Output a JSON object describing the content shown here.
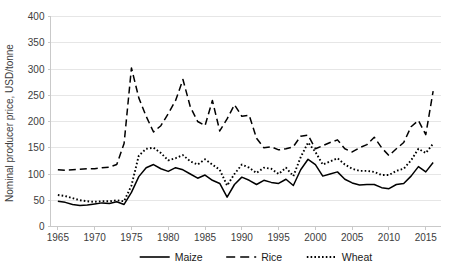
{
  "chart_data": {
    "type": "line",
    "title": "",
    "xlabel": "",
    "ylabel": "Nominal producer price, USD/tonne",
    "xlim": [
      1964,
      2017
    ],
    "ylim": [
      0,
      400
    ],
    "ytick_step": 50,
    "yticks": [
      "0",
      "50",
      "100",
      "150",
      "200",
      "250",
      "300",
      "350",
      "400"
    ],
    "xticks": [
      "1965",
      "1970",
      "1975",
      "1980",
      "1985",
      "1990",
      "1995",
      "2000",
      "2005",
      "2010",
      "2015"
    ],
    "grid": "horizontal",
    "legend_position": "bottom",
    "x": [
      1965,
      1966,
      1967,
      1968,
      1969,
      1970,
      1971,
      1972,
      1973,
      1974,
      1975,
      1976,
      1977,
      1978,
      1979,
      1980,
      1981,
      1982,
      1983,
      1984,
      1985,
      1986,
      1987,
      1988,
      1989,
      1990,
      1991,
      1992,
      1993,
      1994,
      1995,
      1996,
      1997,
      1998,
      1999,
      2000,
      2001,
      2002,
      2003,
      2004,
      2005,
      2006,
      2007,
      2008,
      2009,
      2010,
      2011,
      2012,
      2013,
      2014,
      2015,
      2016
    ],
    "series": [
      {
        "name": "Maize",
        "style": "solid",
        "color": "#000000",
        "values": [
          48,
          46,
          42,
          40,
          41,
          43,
          45,
          44,
          47,
          42,
          65,
          95,
          112,
          118,
          110,
          105,
          112,
          108,
          100,
          92,
          98,
          88,
          82,
          56,
          80,
          94,
          88,
          80,
          88,
          84,
          82,
          90,
          78,
          108,
          128,
          118,
          96,
          100,
          104,
          90,
          83,
          79,
          80,
          80,
          74,
          72,
          80,
          82,
          96,
          114,
          104,
          122
        ],
        "last_peaks": [
          {
            "year": 2008,
            "value": 205
          },
          {
            "year": 2011,
            "value": 272
          }
        ]
      },
      {
        "name": "Rice",
        "style": "dashed",
        "color": "#000000",
        "values": [
          108,
          107,
          108,
          109,
          110,
          110,
          112,
          113,
          118,
          158,
          302,
          245,
          210,
          180,
          192,
          215,
          240,
          280,
          228,
          200,
          192,
          240,
          182,
          205,
          232,
          210,
          212,
          168,
          150,
          152,
          146,
          148,
          152,
          172,
          174,
          148,
          154,
          160,
          165,
          148,
          142,
          150,
          156,
          170,
          150,
          135,
          148,
          160,
          190,
          202,
          175,
          258
        ],
        "peak_notes": [
          {
            "year": 1974,
            "value": 302
          },
          {
            "year": 2008,
            "value": 360
          },
          {
            "year": 2011,
            "value": 348
          }
        ]
      },
      {
        "name": "Wheat",
        "style": "dotted",
        "color": "#000000",
        "values": [
          60,
          58,
          54,
          50,
          48,
          47,
          48,
          48,
          50,
          48,
          78,
          135,
          148,
          150,
          140,
          126,
          130,
          136,
          124,
          118,
          128,
          118,
          108,
          78,
          100,
          118,
          112,
          102,
          112,
          110,
          100,
          112,
          96,
          132,
          160,
          142,
          118,
          124,
          130,
          118,
          110,
          106,
          106,
          104,
          98,
          98,
          106,
          110,
          126,
          148,
          140,
          158
        ]
      }
    ],
    "series_plot": {
      "Maize": [
        [
          1965,
          48
        ],
        [
          1966,
          46
        ],
        [
          1967,
          42
        ],
        [
          1968,
          40
        ],
        [
          1969,
          41
        ],
        [
          1970,
          43
        ],
        [
          1971,
          45
        ],
        [
          1972,
          44
        ],
        [
          1973,
          47
        ],
        [
          1974,
          42
        ],
        [
          1975,
          65
        ],
        [
          1976,
          95
        ],
        [
          1977,
          112
        ],
        [
          1978,
          118
        ],
        [
          1979,
          110
        ],
        [
          1980,
          105
        ],
        [
          1981,
          112
        ],
        [
          1982,
          108
        ],
        [
          1983,
          100
        ],
        [
          1984,
          92
        ],
        [
          1985,
          98
        ],
        [
          1986,
          88
        ],
        [
          1987,
          82
        ],
        [
          1988,
          56
        ],
        [
          1989,
          80
        ],
        [
          1990,
          94
        ],
        [
          1991,
          88
        ],
        [
          1992,
          80
        ],
        [
          1993,
          88
        ],
        [
          1994,
          84
        ],
        [
          1995,
          82
        ],
        [
          1996,
          90
        ],
        [
          1997,
          78
        ],
        [
          1998,
          108
        ],
        [
          1999,
          128
        ],
        [
          2000,
          118
        ],
        [
          2001,
          96
        ],
        [
          2002,
          100
        ],
        [
          2003,
          104
        ],
        [
          2004,
          90
        ],
        [
          2005,
          83
        ],
        [
          2006,
          79
        ],
        [
          2007,
          80
        ],
        [
          2008,
          80
        ],
        [
          2009,
          74
        ],
        [
          2010,
          72
        ],
        [
          2011,
          80
        ],
        [
          2012,
          82
        ],
        [
          2013,
          96
        ],
        [
          2014,
          114
        ],
        [
          2015,
          104
        ],
        [
          2016,
          122
        ]
      ],
      "Rice": [
        [
          1965,
          108
        ],
        [
          1966,
          107
        ],
        [
          1967,
          108
        ],
        [
          1968,
          109
        ],
        [
          1969,
          110
        ],
        [
          1970,
          110
        ],
        [
          1971,
          112
        ],
        [
          1972,
          113
        ],
        [
          1973,
          118
        ],
        [
          1974,
          158
        ],
        [
          1975,
          302
        ],
        [
          1976,
          245
        ],
        [
          1977,
          210
        ],
        [
          1978,
          180
        ],
        [
          1979,
          192
        ],
        [
          1980,
          215
        ],
        [
          1981,
          240
        ],
        [
          1982,
          280
        ],
        [
          1983,
          228
        ],
        [
          1984,
          200
        ],
        [
          1985,
          192
        ],
        [
          1986,
          240
        ],
        [
          1987,
          182
        ],
        [
          1988,
          205
        ],
        [
          1989,
          232
        ],
        [
          1990,
          210
        ],
        [
          1991,
          212
        ],
        [
          1992,
          168
        ],
        [
          1993,
          150
        ],
        [
          1994,
          152
        ],
        [
          1995,
          146
        ],
        [
          1996,
          148
        ],
        [
          1997,
          152
        ],
        [
          1998,
          172
        ],
        [
          1999,
          174
        ],
        [
          2000,
          148
        ],
        [
          2001,
          154
        ],
        [
          2002,
          160
        ],
        [
          2003,
          165
        ],
        [
          2004,
          148
        ],
        [
          2005,
          142
        ],
        [
          2006,
          150
        ],
        [
          2007,
          156
        ],
        [
          2008,
          170
        ],
        [
          2009,
          150
        ],
        [
          2010,
          135
        ],
        [
          2011,
          148
        ],
        [
          2012,
          160
        ],
        [
          2013,
          190
        ],
        [
          2014,
          202
        ],
        [
          2015,
          175
        ],
        [
          2016,
          258
        ]
      ],
      "Wheat": [
        [
          1965,
          60
        ],
        [
          1966,
          58
        ],
        [
          1967,
          54
        ],
        [
          1968,
          50
        ],
        [
          1969,
          48
        ],
        [
          1970,
          47
        ],
        [
          1971,
          48
        ],
        [
          1972,
          48
        ],
        [
          1973,
          50
        ],
        [
          1974,
          48
        ],
        [
          1975,
          78
        ],
        [
          1976,
          135
        ],
        [
          1977,
          148
        ],
        [
          1978,
          150
        ],
        [
          1979,
          140
        ],
        [
          1980,
          126
        ],
        [
          1981,
          130
        ],
        [
          1982,
          136
        ],
        [
          1983,
          124
        ],
        [
          1984,
          118
        ],
        [
          1985,
          128
        ],
        [
          1986,
          118
        ],
        [
          1987,
          108
        ],
        [
          1988,
          78
        ],
        [
          1989,
          100
        ],
        [
          1990,
          118
        ],
        [
          1991,
          112
        ],
        [
          1992,
          102
        ],
        [
          1993,
          112
        ],
        [
          1994,
          110
        ],
        [
          1995,
          100
        ],
        [
          1996,
          112
        ],
        [
          1997,
          96
        ],
        [
          1998,
          132
        ],
        [
          1999,
          160
        ],
        [
          2000,
          142
        ],
        [
          2001,
          118
        ],
        [
          2002,
          124
        ],
        [
          2003,
          130
        ],
        [
          2004,
          118
        ],
        [
          2005,
          110
        ],
        [
          2006,
          106
        ],
        [
          2007,
          106
        ],
        [
          2008,
          104
        ],
        [
          2009,
          98
        ],
        [
          2010,
          98
        ],
        [
          2011,
          106
        ],
        [
          2012,
          110
        ],
        [
          2013,
          126
        ],
        [
          2014,
          148
        ],
        [
          2015,
          140
        ],
        [
          2016,
          158
        ]
      ]
    }
  },
  "legend": {
    "items": [
      {
        "label": "Maize",
        "style": "solid"
      },
      {
        "label": "Rice",
        "style": "dashed"
      },
      {
        "label": "Wheat",
        "style": "dotted"
      }
    ]
  }
}
